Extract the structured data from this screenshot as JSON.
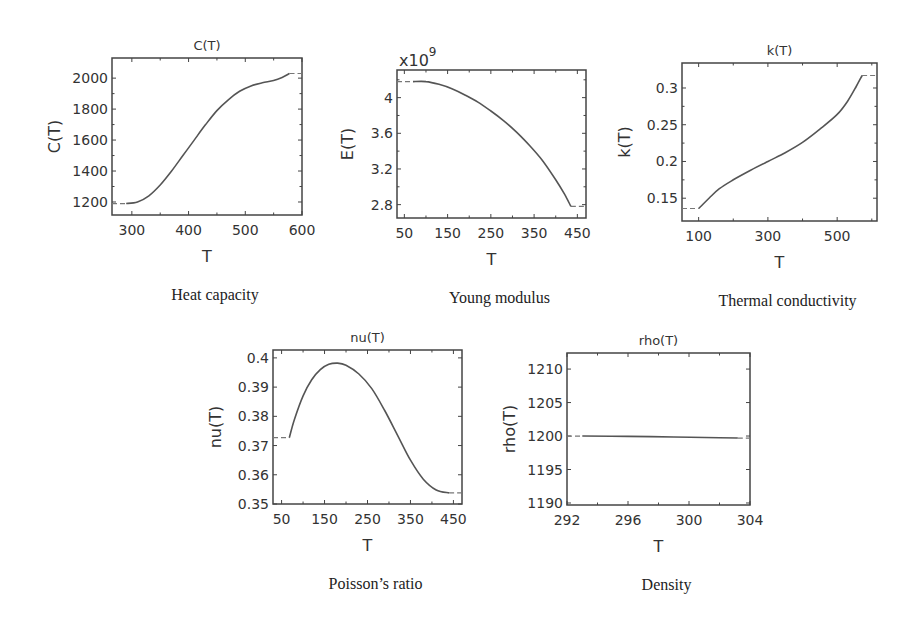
{
  "chart_data": [
    {
      "id": "heat-capacity",
      "type": "line",
      "title": "C(T)",
      "xlabel": "T",
      "ylabel": "C(T)",
      "caption": "Heat capacity",
      "multiplier": "",
      "box": [
        112,
        58,
        302,
        215
      ],
      "xlim": [
        265,
        600
      ],
      "ylim": [
        1116,
        2130
      ],
      "xticks": [
        300,
        400,
        500,
        600
      ],
      "xticklabels": [
        "300",
        "400",
        "500",
        "600"
      ],
      "xminor": [
        350,
        450,
        550
      ],
      "yticks": [
        1200,
        1400,
        1600,
        1800,
        2000
      ],
      "yticklabels": [
        "1200",
        "1400",
        "1600",
        "1800",
        "2000"
      ],
      "yminor": [
        1300,
        1500,
        1700,
        1900
      ],
      "ext_left": [
        [
          265,
          1190
        ],
        [
          290,
          1190
        ]
      ],
      "ext_right": [
        [
          578,
          2030
        ],
        [
          600,
          2030
        ]
      ],
      "x": [
        290,
        310,
        330,
        350,
        370,
        390,
        410,
        430,
        450,
        470,
        490,
        510,
        530,
        550,
        565,
        578
      ],
      "y": [
        1190,
        1200,
        1240,
        1310,
        1400,
        1500,
        1600,
        1700,
        1790,
        1860,
        1915,
        1950,
        1970,
        1985,
        2005,
        2030
      ]
    },
    {
      "id": "young-modulus",
      "type": "line",
      "title": "",
      "xlabel": "T",
      "ylabel": "E(T)",
      "caption": "Young modulus",
      "multiplier": "x10",
      "multiplier_exp": "9",
      "box": [
        397,
        70,
        586,
        218
      ],
      "xlim": [
        33,
        470
      ],
      "ylim": [
        2.65,
        4.31
      ],
      "xticks": [
        50,
        150,
        250,
        350,
        450
      ],
      "xticklabels": [
        "50",
        "150",
        "250",
        "350",
        "450"
      ],
      "xminor": [
        100,
        200,
        300,
        400
      ],
      "yticks": [
        2.8,
        3.2,
        3.6,
        4.0
      ],
      "yticklabels": [
        "2.8",
        "3.2",
        "3.6",
        "4"
      ],
      "yminor": [
        3.0,
        3.4,
        3.8,
        4.2
      ],
      "ext_left": [
        [
          33,
          4.18
        ],
        [
          70,
          4.18
        ]
      ],
      "ext_right": [
        [
          435,
          2.78
        ],
        [
          470,
          2.78
        ]
      ],
      "x": [
        70,
        100,
        130,
        160,
        190,
        220,
        250,
        280,
        310,
        340,
        370,
        400,
        420,
        435
      ],
      "y": [
        4.18,
        4.18,
        4.15,
        4.1,
        4.03,
        3.95,
        3.85,
        3.74,
        3.61,
        3.46,
        3.29,
        3.08,
        2.92,
        2.78
      ]
    },
    {
      "id": "thermal-conductivity",
      "type": "line",
      "title": "k(T)",
      "xlabel": "T",
      "ylabel": "k(T)",
      "caption": "Thermal conductivity",
      "multiplier": "",
      "box": [
        682,
        63,
        877,
        221
      ],
      "xlim": [
        52,
        615
      ],
      "ylim": [
        0.119,
        0.334
      ],
      "xticks": [
        100,
        300,
        500
      ],
      "xticklabels": [
        "100",
        "300",
        "500"
      ],
      "xminor": [
        200,
        400,
        600
      ],
      "yticks": [
        0.15,
        0.2,
        0.25,
        0.3
      ],
      "yticklabels": [
        "0.15",
        "0.2",
        "0.25",
        "0.3"
      ],
      "yminor": [
        0.175,
        0.225,
        0.275
      ],
      "ext_left": [
        [
          52,
          0.136
        ],
        [
          100,
          0.136
        ]
      ],
      "ext_right": [
        [
          572,
          0.317
        ],
        [
          615,
          0.317
        ]
      ],
      "x": [
        100,
        130,
        160,
        200,
        250,
        300,
        350,
        400,
        450,
        500,
        530,
        555,
        572
      ],
      "y": [
        0.136,
        0.15,
        0.163,
        0.175,
        0.188,
        0.2,
        0.212,
        0.226,
        0.244,
        0.264,
        0.282,
        0.302,
        0.317
      ]
    },
    {
      "id": "poisson-ratio",
      "type": "line",
      "title": "nu(T)",
      "xlabel": "T",
      "ylabel": "nu(T)",
      "caption": "Poisson’s ratio",
      "multiplier": "",
      "box": [
        273,
        350,
        462,
        504
      ],
      "xlim": [
        30,
        470
      ],
      "ylim": [
        0.35,
        0.4027
      ],
      "xticks": [
        50,
        150,
        250,
        350,
        450
      ],
      "xticklabels": [
        "50",
        "150",
        "250",
        "350",
        "450"
      ],
      "xminor": [
        100,
        200,
        300,
        400
      ],
      "yticks": [
        0.35,
        0.36,
        0.37,
        0.38,
        0.39,
        0.4
      ],
      "yticklabels": [
        "0.35",
        "0.36",
        "0.37",
        "0.38",
        "0.39",
        "0.4"
      ],
      "yminor": [],
      "ext_left": [
        [
          30,
          0.3727
        ],
        [
          68,
          0.3727
        ]
      ],
      "ext_right": [
        [
          440,
          0.3538
        ],
        [
          470,
          0.3538
        ]
      ],
      "x": [
        68,
        80,
        100,
        120,
        140,
        160,
        180,
        200,
        230,
        260,
        290,
        320,
        350,
        380,
        410,
        440
      ],
      "y": [
        0.3727,
        0.379,
        0.387,
        0.3925,
        0.396,
        0.3978,
        0.3982,
        0.3975,
        0.3945,
        0.3895,
        0.382,
        0.3735,
        0.365,
        0.3585,
        0.3548,
        0.3538
      ]
    },
    {
      "id": "density",
      "type": "line",
      "title": "rho(T)",
      "xlabel": "T",
      "ylabel": "rho(T)",
      "caption": "Density",
      "multiplier": "",
      "box": [
        567,
        353,
        750,
        505
      ],
      "xlim": [
        292,
        304
      ],
      "ylim": [
        1189.7,
        1212.4
      ],
      "xticks": [
        292,
        296,
        300,
        304
      ],
      "xticklabels": [
        "292",
        "296",
        "300",
        "304"
      ],
      "xminor": [
        294,
        298,
        302
      ],
      "yticks": [
        1190,
        1195,
        1200,
        1205,
        1210
      ],
      "yticklabels": [
        "1190",
        "1195",
        "1200",
        "1205",
        "1210"
      ],
      "yminor": [],
      "ext_left": [
        [
          292,
          1200.0
        ],
        [
          293,
          1200.0
        ]
      ],
      "ext_right": [
        [
          303.2,
          1199.7
        ],
        [
          304,
          1199.7
        ]
      ],
      "x": [
        293,
        296,
        299,
        302,
        303.2
      ],
      "y": [
        1200.0,
        1199.95,
        1199.85,
        1199.75,
        1199.7
      ]
    }
  ]
}
